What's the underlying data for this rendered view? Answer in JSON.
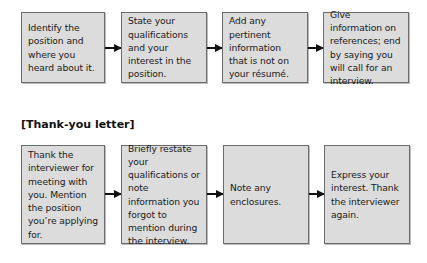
{
  "application_letter": {
    "steps": [
      {
        "text": "Identify the position and where you heard about it."
      },
      {
        "text": "State your qualifications and your interest in the position."
      },
      {
        "text": "Add any pertinent information that is not on your résumé."
      },
      {
        "text": "Give information on references; end by saying you will call for an interview."
      }
    ]
  },
  "thank_you_letter": {
    "title": "[Thank-you letter]",
    "steps": [
      {
        "text": "Thank the interviewer for meeting with you. Mention the position you’re applying for."
      },
      {
        "text": "Briefly restate your qualifications or note information you forgot to mention during the interview."
      },
      {
        "text": "Note any enclosures."
      },
      {
        "text": "Express your interest. Thank the interviewer again."
      }
    ]
  },
  "colors": {
    "box_fill": "#dcdcdc",
    "box_border": "#6b6b6b",
    "arrow": "#111111"
  }
}
